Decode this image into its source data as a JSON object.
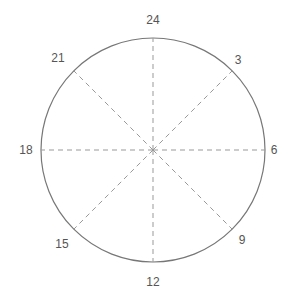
{
  "diagram": {
    "type": "radial-clock-24h",
    "center": [
      153,
      150
    ],
    "radius": 112,
    "circle_color": "#777777",
    "spoke_color": "#999999",
    "labels": [
      {
        "text": "24",
        "x": 153,
        "y": 20
      },
      {
        "text": "3",
        "x": 238,
        "y": 60
      },
      {
        "text": "6",
        "x": 274,
        "y": 150
      },
      {
        "text": "9",
        "x": 242,
        "y": 240
      },
      {
        "text": "12",
        "x": 153,
        "y": 282
      },
      {
        "text": "15",
        "x": 62,
        "y": 244
      },
      {
        "text": "18",
        "x": 26,
        "y": 150
      },
      {
        "text": "21",
        "x": 58,
        "y": 58
      }
    ]
  }
}
